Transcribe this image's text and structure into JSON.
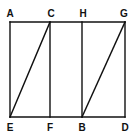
{
  "diagram": {
    "title": "",
    "points": {
      "A": "A",
      "C": "C",
      "H": "H",
      "G": "G",
      "E": "E",
      "F": "F",
      "B": "B",
      "D": "D"
    },
    "segments": [
      [
        "A",
        "G"
      ],
      [
        "E",
        "D"
      ],
      [
        "A",
        "E"
      ],
      [
        "C",
        "F"
      ],
      [
        "H",
        "B"
      ],
      [
        "G",
        "D"
      ],
      [
        "E",
        "C"
      ],
      [
        "B",
        "G"
      ]
    ],
    "line_color": "#111111",
    "background": "#ffffff"
  }
}
